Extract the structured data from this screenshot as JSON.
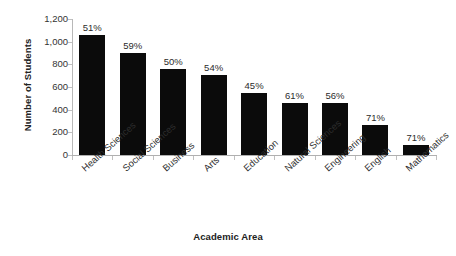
{
  "chart_data": {
    "type": "bar",
    "title": "",
    "xlabel": "Academic Area",
    "ylabel": "Number of Students",
    "categories": [
      "Health Sciences",
      "Social Sciences",
      "Business",
      "Arts",
      "Education",
      "Natural Sciences",
      "Engineering",
      "English",
      "Mathematics"
    ],
    "values": [
      1055,
      900,
      755,
      705,
      545,
      460,
      460,
      265,
      85
    ],
    "point_labels": [
      "51%",
      "59%",
      "50%",
      "54%",
      "45%",
      "61%",
      "56%",
      "71%",
      "71%"
    ],
    "ylim": [
      0,
      1200
    ],
    "yticks": [
      0,
      200,
      400,
      600,
      800,
      1000,
      1200
    ],
    "ytick_labels": [
      "0",
      "200",
      "400",
      "600",
      "800",
      "1,000",
      "1,200"
    ],
    "grid": false,
    "legend": null,
    "bar_color": "#0b0b0b",
    "background_color": "#ffffff",
    "axis_color": "#b0b0b0"
  }
}
